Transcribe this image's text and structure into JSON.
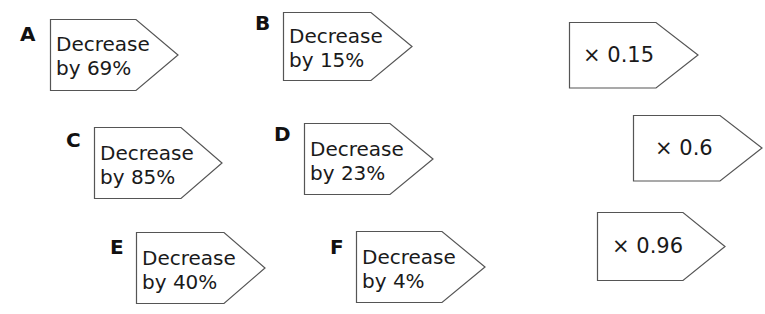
{
  "cards": {
    "A": {
      "letter": "A",
      "line1": "Decrease",
      "line2": "by 69%"
    },
    "B": {
      "letter": "B",
      "line1": "Decrease",
      "line2": "by 15%"
    },
    "C": {
      "letter": "C",
      "line1": "Decrease",
      "line2": "by 85%"
    },
    "D": {
      "letter": "D",
      "line1": "Decrease",
      "line2": "by 23%"
    },
    "E": {
      "letter": "E",
      "line1": "Decrease",
      "line2": "by 40%"
    },
    "F": {
      "letter": "F",
      "line1": "Decrease",
      "line2": "by 4%"
    }
  },
  "multipliers": [
    {
      "label": "× 0.15"
    },
    {
      "label": "× 0.6"
    },
    {
      "label": "× 0.96"
    }
  ],
  "colors": {
    "stroke": "#555555",
    "text": "#1a1a1a",
    "background": "#ffffff"
  }
}
